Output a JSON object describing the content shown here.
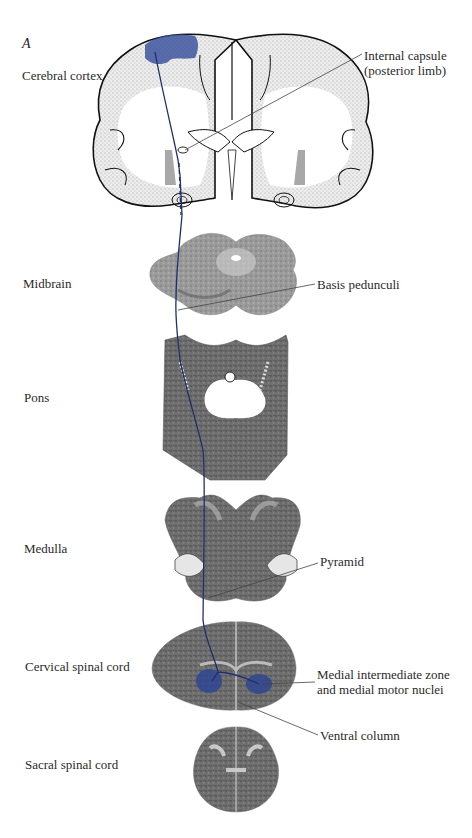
{
  "figure": {
    "panel_letter": "A",
    "tract_color": "#1f2f6e",
    "highlight_color": "#3d55a0",
    "levels": [
      {
        "id": "cerebral-cortex",
        "label": "Cerebral cortex"
      },
      {
        "id": "midbrain",
        "label": "Midbrain"
      },
      {
        "id": "pons",
        "label": "Pons"
      },
      {
        "id": "medulla",
        "label": "Medulla"
      },
      {
        "id": "cervical-spinal-cord",
        "label": "Cervical spinal cord"
      },
      {
        "id": "sacral-spinal-cord",
        "label": "Sacral spinal cord"
      }
    ],
    "callouts": [
      {
        "id": "internal-capsule",
        "line1": "Internal capsule",
        "line2": "(posterior limb)"
      },
      {
        "id": "basis-pedunculi",
        "line1": "Basis pedunculi"
      },
      {
        "id": "pyramid",
        "line1": "Pyramid"
      },
      {
        "id": "medial-intermediate-zone",
        "line1": "Medial intermediate zone",
        "line2": "and medial motor nuclei"
      },
      {
        "id": "ventral-column",
        "line1": "Ventral column"
      }
    ]
  }
}
